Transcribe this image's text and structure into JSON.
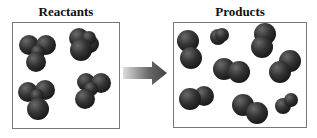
{
  "diagram": {
    "left_panel": {
      "title": "Reactants",
      "molecules": 4,
      "atoms_per_molecule": 4
    },
    "right_panel": {
      "title": "Products",
      "molecules": 8,
      "atoms_per_molecule": 2
    },
    "arrow": "reaction-arrow",
    "colors": {
      "atom": "#2e2e2e",
      "border": "#777777",
      "arrow": "#555555"
    }
  }
}
